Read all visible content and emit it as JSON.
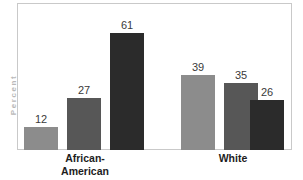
{
  "chart_data": {
    "type": "bar",
    "title": "",
    "xlabel": "",
    "ylabel": "Percent",
    "ylim": [
      0,
      68
    ],
    "grid": false,
    "legend": "none",
    "categories": [
      "African-American",
      "White"
    ],
    "series": [
      {
        "name": "series-1",
        "color": "#8c8c8c",
        "values": [
          12,
          39
        ]
      },
      {
        "name": "series-2",
        "color": "#575757",
        "values": [
          27,
          35
        ]
      },
      {
        "name": "series-3",
        "color": "#2b2b2b",
        "values": [
          61,
          26
        ]
      }
    ],
    "bars": [
      {
        "group": "African-American",
        "value": 12,
        "label": "12",
        "color": "#8c8c8c",
        "x": 6,
        "width": 34
      },
      {
        "group": "African-American",
        "value": 27,
        "label": "27",
        "color": "#575757",
        "x": 49,
        "width": 34
      },
      {
        "group": "African-American",
        "value": 61,
        "label": "61",
        "color": "#2b2b2b",
        "x": 92,
        "width": 34
      },
      {
        "group": "White",
        "value": 39,
        "label": "39",
        "color": "#8c8c8c",
        "x": 163,
        "width": 34
      },
      {
        "group": "White",
        "value": 35,
        "label": "35",
        "color": "#575757",
        "x": 206,
        "width": 34
      },
      {
        "group": "White",
        "value": 26,
        "label": "26",
        "color": "#2b2b2b",
        "x": 232,
        "width": 34
      }
    ]
  },
  "axis": {
    "y_title": "Percent"
  },
  "labels": {
    "group_left": "African-\nAmerican",
    "group_right": "White"
  },
  "colors": {
    "background": "#ffffff",
    "frame": "#c9c9c9",
    "value_text": "#3a3a3a",
    "category_text": "#1d1d1d",
    "axis_title": "#b9b9b9"
  }
}
